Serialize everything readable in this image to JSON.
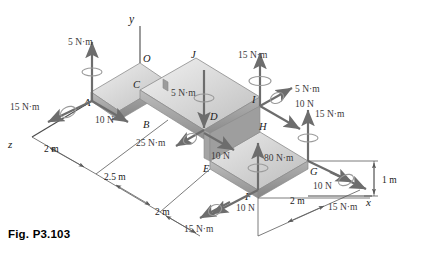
{
  "figure": {
    "caption": "Fig. P3.103",
    "type": "mechanics-free-body-diagram"
  },
  "axes": [
    {
      "name": "y-axis",
      "label": "y"
    },
    {
      "name": "x-axis",
      "label": "x"
    },
    {
      "name": "z-axis",
      "label": "z"
    }
  ],
  "points": [
    {
      "id": "A",
      "label": "A"
    },
    {
      "id": "B",
      "label": "B"
    },
    {
      "id": "C",
      "label": "C"
    },
    {
      "id": "D",
      "label": "D"
    },
    {
      "id": "E",
      "label": "E"
    },
    {
      "id": "F",
      "label": "F"
    },
    {
      "id": "G",
      "label": "G"
    },
    {
      "id": "H",
      "label": "H"
    },
    {
      "id": "I",
      "label": "I"
    },
    {
      "id": "J",
      "label": "J"
    },
    {
      "id": "O",
      "label": "O"
    }
  ],
  "loads": [
    {
      "id": "couple-A-vertical",
      "label": "5 N·m",
      "kind": "couple",
      "at": "A"
    },
    {
      "id": "couple-A-z",
      "label": "15 N·m",
      "kind": "couple",
      "at": "A"
    },
    {
      "id": "force-A-10N",
      "label": "10 N",
      "kind": "force",
      "at": "A"
    },
    {
      "id": "couple-B-25",
      "label": "25 N·m",
      "kind": "couple",
      "at": "B"
    },
    {
      "id": "couple-D-5",
      "label": "5 N·m",
      "kind": "couple",
      "at": "D"
    },
    {
      "id": "force-D-10N",
      "label": "10 N",
      "kind": "force",
      "at": "D"
    },
    {
      "id": "couple-I-15",
      "label": "15 N·m",
      "kind": "couple",
      "at": "I"
    },
    {
      "id": "couple-I-5",
      "label": "5 N·m",
      "kind": "couple",
      "at": "I"
    },
    {
      "id": "force-I-10N",
      "label": "10 N",
      "kind": "force",
      "at": "I"
    },
    {
      "id": "couple-H-15",
      "label": "15 N·m",
      "kind": "couple",
      "at": "H"
    },
    {
      "id": "couple-F-80",
      "label": "80 N·m",
      "kind": "couple",
      "at": "F"
    },
    {
      "id": "force-F-10N",
      "label": "10 N",
      "kind": "force",
      "at": "F"
    },
    {
      "id": "couple-F-15",
      "label": "15 N·m",
      "kind": "couple",
      "at": "F"
    },
    {
      "id": "force-G-10N",
      "label": "10 N",
      "kind": "force",
      "at": "G"
    },
    {
      "id": "couple-G-15",
      "label": "15 N·m",
      "kind": "couple",
      "at": "G"
    }
  ],
  "dimensions": [
    {
      "id": "dim-z-2m",
      "label": "2 m"
    },
    {
      "id": "dim-2p5m",
      "label": "2.5 m"
    },
    {
      "id": "dim-mid-2m",
      "label": "2 m"
    },
    {
      "id": "dim-1m",
      "label": "1 m"
    },
    {
      "id": "dim-x-2m",
      "label": "2 m"
    }
  ],
  "colors": {
    "ink": "#2b2b2b",
    "arrow": "#6d6d6d",
    "plate_top_light": "#e9e9e9",
    "plate_top_mid": "#c8c8c8",
    "plate_edge_dark": "#9a9a9a",
    "plate_side": "#b4b4b4",
    "dim_line": "#5a5a5a"
  }
}
